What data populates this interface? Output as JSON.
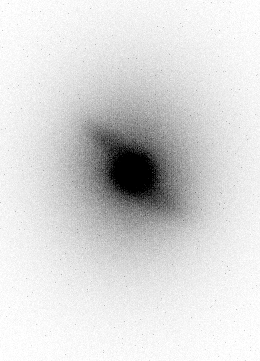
{
  "image": {
    "description": "Inverted-grayscale astronomical image: a diffuse galaxy halo with a dark compact nucleus and a diagonal bar/arm structure on a white background, with fine pixel grain noise and subtle vertical column striping",
    "width": 260,
    "height": 361,
    "background_color": "#ffffff",
    "foreground_color": "#000000",
    "colormap": "inverted-grayscale",
    "components": [
      {
        "name": "halo-outer",
        "cx": 132,
        "cy": 168,
        "sigma_major": 102,
        "sigma_minor": 88,
        "angle_deg": 90,
        "peak": 22
      },
      {
        "name": "halo-mid",
        "cx": 132,
        "cy": 168,
        "sigma_major": 72,
        "sigma_minor": 60,
        "angle_deg": 90,
        "peak": 45
      },
      {
        "name": "halo-inner",
        "cx": 132,
        "cy": 169,
        "sigma_major": 48,
        "sigma_minor": 42,
        "angle_deg": 90,
        "peak": 60
      },
      {
        "name": "bulge",
        "cx": 134,
        "cy": 172,
        "sigma_major": 34,
        "sigma_minor": 25,
        "angle_deg": 35,
        "peak": 75
      },
      {
        "name": "nucleus",
        "cx": 132,
        "cy": 172,
        "sigma_major": 13,
        "sigma_minor": 12,
        "angle_deg": 0,
        "peak": 235
      },
      {
        "name": "arm-upper-left",
        "cx": 107,
        "cy": 141,
        "sigma_major": 20,
        "sigma_minor": 8,
        "angle_deg": 38,
        "peak": 48
      },
      {
        "name": "arm-lower-right",
        "cx": 158,
        "cy": 198,
        "sigma_major": 24,
        "sigma_minor": 10,
        "angle_deg": 28,
        "peak": 40
      }
    ],
    "noise": {
      "seed": 1337,
      "base_sigma": 3.5,
      "signal_sigma_factor": 0.065,
      "stripe_factor": 0.03,
      "speckle_probability": 0.0035,
      "speckle_min": 15,
      "speckle_max": 55
    }
  }
}
